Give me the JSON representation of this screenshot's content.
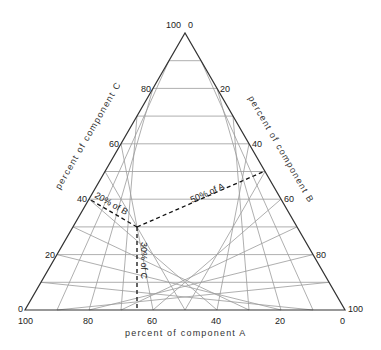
{
  "diagram": {
    "type": "ternary",
    "axes": {
      "A": {
        "label": "percent of component A",
        "ticks": [
          "100",
          "80",
          "60",
          "40",
          "20",
          "0"
        ]
      },
      "B": {
        "label": "percent of component B",
        "ticks": [
          "0",
          "20",
          "40",
          "60",
          "80",
          "100"
        ]
      },
      "C": {
        "label": "percent of component C",
        "ticks": [
          "0",
          "20",
          "40",
          "60",
          "80",
          "100"
        ]
      }
    },
    "grid_step_percent": 10,
    "point": {
      "A": 50,
      "B": 20,
      "C": 30
    },
    "annotations": {
      "a": "50% of A",
      "b": "20% of B",
      "c": "30% of C"
    },
    "colors": {
      "outline": "#333333",
      "grid": "#9a9a9a",
      "dashed": "#111111"
    }
  }
}
